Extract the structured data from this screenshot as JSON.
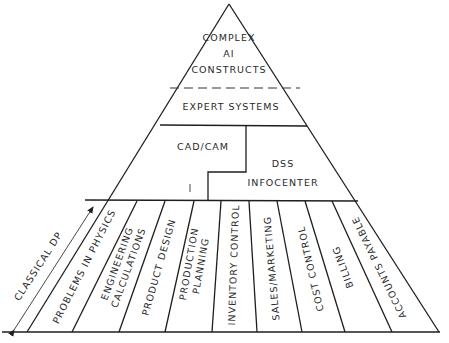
{
  "diagram": {
    "type": "pyramid",
    "tiers": {
      "top": {
        "lines": [
          "COMPLEX",
          "AI",
          "CONSTRUCTS"
        ]
      },
      "expert": {
        "label": "EXPERT SYSTEMS"
      },
      "middle_left": {
        "label": "CAD/CAM"
      },
      "middle_right": {
        "lines": [
          "DSS",
          "INFOCENTER"
        ]
      }
    },
    "base_columns": [
      {
        "lines": [
          "PROBLEMS IN PHYSICS"
        ]
      },
      {
        "lines": [
          "ENGINEERING",
          "CALCULATIONS"
        ]
      },
      {
        "lines": [
          "PRODUCT DESIGN"
        ]
      },
      {
        "lines": [
          "PRODUCTION",
          "PLANNING"
        ]
      },
      {
        "lines": [
          "INVENTORY CONTROL"
        ]
      },
      {
        "lines": [
          "SALES/MARKETING"
        ]
      },
      {
        "lines": [
          "COST CONTROL"
        ]
      },
      {
        "lines": [
          "BILLING"
        ]
      },
      {
        "lines": [
          "ACCOUNTS PAYABLE"
        ]
      }
    ],
    "side_annotation": {
      "label": "CLASSICAL DP"
    }
  }
}
